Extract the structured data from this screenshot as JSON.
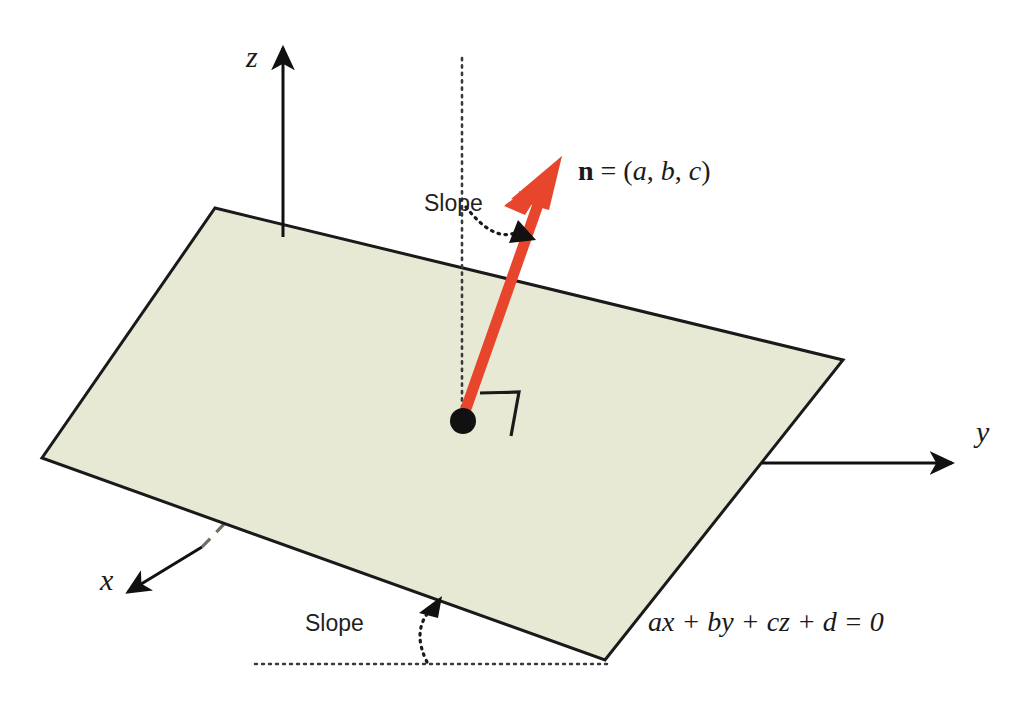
{
  "figure": {
    "type": "3d-geometry-diagram"
  },
  "axes": {
    "z_label": "z",
    "y_label": "y",
    "x_label": "x"
  },
  "annotations": {
    "normal_vector": {
      "symbol": "n",
      "equals": " = (",
      "comp_a": "a",
      "sep1": ", ",
      "comp_b": "b",
      "sep2": ", ",
      "comp_c": "c",
      "close": ")"
    },
    "slope_upper": "Slope",
    "slope_lower": "Slope",
    "plane_equation": "ax + by + cz + d = 0"
  },
  "colors": {
    "plane_fill": "#e8e9d5",
    "plane_stroke": "#1a1a1a",
    "normal_arrow": "#e8462c",
    "axis": "#111111",
    "dashed_axis": "#6f6f63",
    "dotted_guide": "#3a3a3a",
    "point": "#111111",
    "background": "#ffffff"
  },
  "geometry": {
    "plane_corners": [
      [
        215,
        208
      ],
      [
        843,
        360
      ],
      [
        605,
        660
      ],
      [
        42,
        458
      ]
    ],
    "origin_point": [
      462,
      420
    ],
    "normal_tip": [
      560,
      160
    ],
    "z_axis": [
      [
        283,
        38
      ],
      [
        283,
        560
      ]
    ],
    "y_axis_end": [
      962,
      463
    ],
    "x_axis_end": [
      118,
      600
    ]
  }
}
